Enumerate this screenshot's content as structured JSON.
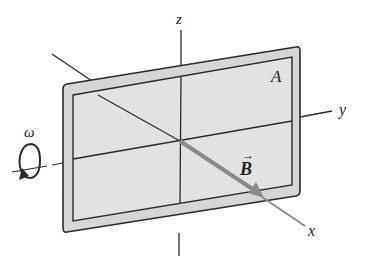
{
  "diagram": {
    "labels": {
      "z_axis": "z",
      "y_axis": "y",
      "x_axis": "x",
      "area": "A",
      "field": "B",
      "field_arrow": "→",
      "angular_velocity": "ω"
    },
    "colors": {
      "frame_fill": "#d6d6d6",
      "plate_fill": "#e2e2e2",
      "stroke": "#2a2a2a",
      "field_vector": "#8a8a8a"
    }
  }
}
